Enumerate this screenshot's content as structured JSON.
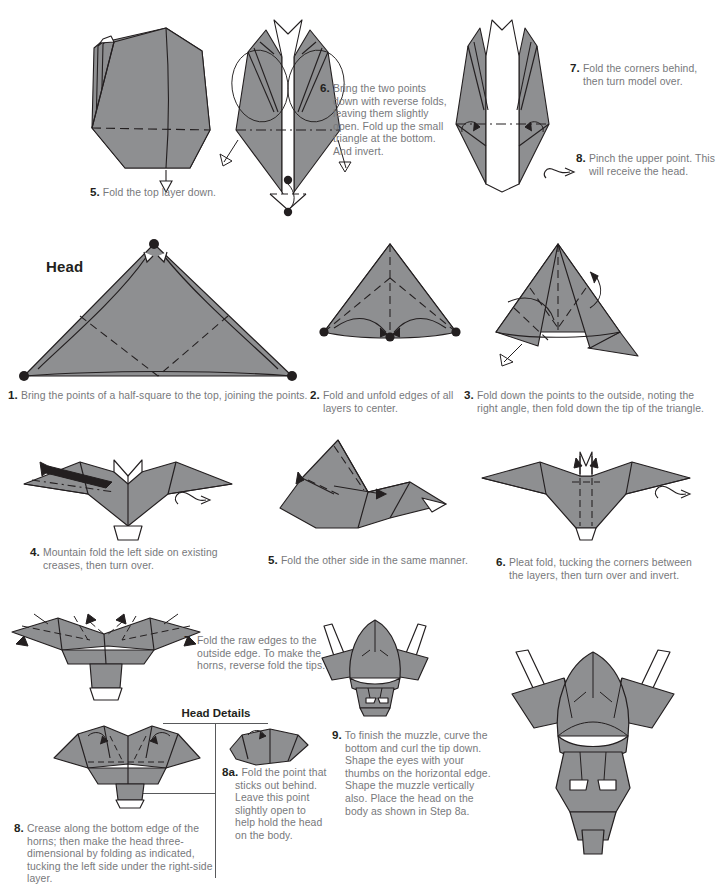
{
  "page": {
    "width": 706,
    "height": 894,
    "paper_fill": "#8e8f91",
    "paper_fill_light": "#a8a9ab",
    "paper_white": "#ffffff",
    "line_color": "#231f20",
    "text_color": "#77787b",
    "heading_color": "#231f20"
  },
  "sections": [
    {
      "id": "head-section",
      "title": "Head"
    },
    {
      "id": "head-details",
      "title": "Head Details"
    }
  ],
  "body_steps": [
    {
      "number": "5.",
      "text": "Fold the top layer down.",
      "figure": "body-step-5-figure"
    },
    {
      "number": "6.",
      "text": "Bring the two points down with reverse folds, leaving them slightly open. Fold up the small triangle at the bottom. And invert.",
      "figure": "body-step-6-figure"
    },
    {
      "number": "7.",
      "text": "Fold the corners behind, then turn model over.",
      "figure": "body-step-7-figure"
    },
    {
      "number": "8.",
      "text": "Pinch the upper point. This will receive the head.",
      "figure": "body-step-8-figure"
    }
  ],
  "head_steps": [
    {
      "number": "1.",
      "text": "Bring the points of a half-square to the top, joining the points.",
      "figure": "head-step-1-figure"
    },
    {
      "number": "2.",
      "text": "Fold and unfold edges of all layers to center.",
      "figure": "head-step-2-figure"
    },
    {
      "number": "3.",
      "text": "Fold down the points to the outside, noting the right angle, then fold down the tip of the triangle.",
      "figure": "head-step-3-figure"
    },
    {
      "number": "4.",
      "text": "Mountain fold the left side on existing creases, then turn over.",
      "figure": "head-step-4-figure"
    },
    {
      "number": "5.",
      "text": "Fold the other side in the same manner.",
      "figure": "head-step-5-figure"
    },
    {
      "number": "6.",
      "text": "Pleat fold, tucking the corners between the layers, then turn over and invert.",
      "figure": "head-step-6-figure"
    },
    {
      "number": "7.",
      "text": "Fold the raw edges to the outside edge. To make the horns, reverse fold the tips.",
      "figure": "head-step-7-figure"
    },
    {
      "number": "8.",
      "text": "Crease along the bottom edge of the horns; then make the head three-dimensional by folding as indicated, tucking the left side under the right-side layer.",
      "figure": "head-step-8-figure"
    },
    {
      "number": "8a.",
      "text": "Fold the point that sticks out behind. Leave this point slightly open to help hold the head on the body.",
      "figure": "head-step-8a-figure"
    },
    {
      "number": "9.",
      "text": "To finish the muzzle, curve the bottom and curl the tip down. Shape the eyes with your thumbs on the horizontal edge. Shape the muzzle vertically also. Place the head on the body as shown in Step 8a.",
      "figure": "head-step-9-figure"
    }
  ],
  "final_figure": {
    "name": "finished-bison-head-figure"
  }
}
